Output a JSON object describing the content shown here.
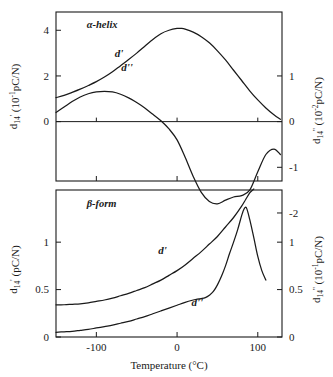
{
  "figure": {
    "xaxis": {
      "label": "Temperature (°C)",
      "ticks": [
        "-100",
        "0",
        "100"
      ],
      "tick_values": [
        -100,
        0,
        100
      ],
      "range": [
        -150,
        130
      ]
    },
    "panels": [
      {
        "name": "alpha-helix",
        "label": "α-helix",
        "left_axis": {
          "symbol": "d",
          "subscript": "14",
          "prime": "'",
          "units": "(10⁻¹pC/N)",
          "text": "d₁₄' (10⁻¹pC/N)",
          "ticks": [
            "0",
            "2",
            "4"
          ],
          "tick_values": [
            0,
            2,
            4
          ],
          "range": [
            -2.6,
            4.8
          ]
        },
        "right_axis": {
          "symbol": "d",
          "subscript": "14",
          "prime": "''",
          "units": "(10⁻²pC/N)",
          "text": "d₁₄'' (10⁻²pC/N)",
          "ticks": [
            "1",
            "0",
            "-1",
            "-2"
          ],
          "tick_values": [
            1,
            0,
            -1,
            -2
          ],
          "range": [
            -2.6,
            4.8
          ]
        },
        "curve_labels": [
          "d'",
          "d''"
        ]
      },
      {
        "name": "beta-form",
        "label": "β-form",
        "left_axis": {
          "symbol": "d",
          "subscript": "14",
          "prime": "'",
          "units": "(pC/N)",
          "text": "d₁₄' (pC/N)",
          "ticks": [
            "0",
            "0.5",
            "1"
          ],
          "tick_values": [
            0,
            0.5,
            1
          ],
          "range": [
            0,
            1.55
          ]
        },
        "right_axis": {
          "symbol": "d",
          "subscript": "14",
          "prime": "''",
          "units": "(10⁻¹pC/N)",
          "text": "d₁₄'' (10⁻¹pC/N)",
          "ticks": [
            "0",
            "0.5",
            "1"
          ],
          "tick_values": [
            0,
            0.5,
            1
          ],
          "range": [
            0,
            1.55
          ]
        },
        "curve_labels": [
          "d'",
          "d''"
        ]
      }
    ]
  },
  "chart_data": [
    {
      "type": "line",
      "title": "α-helix",
      "xlabel": "Temperature (°C)",
      "ylabel": "d₁₄' (10⁻¹pC/N)",
      "ylabel_right": "d₁₄'' (10⁻²pC/N)",
      "xlim": [
        -150,
        130
      ],
      "ylim": [
        -2.6,
        4.8
      ],
      "grid": false,
      "legend": "inline-annotations",
      "series": [
        {
          "name": "d'",
          "axis": "left",
          "label_position": {
            "x": -72,
            "y": 2.85
          },
          "x": [
            -150,
            -140,
            -130,
            -120,
            -110,
            -100,
            -90,
            -80,
            -70,
            -60,
            -50,
            -40,
            -30,
            -20,
            -10,
            0,
            5,
            10,
            20,
            30,
            40,
            50,
            60,
            70,
            80,
            90,
            100,
            110,
            120,
            128
          ],
          "y": [
            1.05,
            1.15,
            1.28,
            1.42,
            1.58,
            1.75,
            1.95,
            2.18,
            2.45,
            2.72,
            3.0,
            3.3,
            3.6,
            3.85,
            4.0,
            4.08,
            4.08,
            4.05,
            3.92,
            3.72,
            3.45,
            3.1,
            2.7,
            2.25,
            1.8,
            1.35,
            0.95,
            0.6,
            0.3,
            0.1
          ]
        },
        {
          "name": "d''",
          "axis": "right",
          "label_position": {
            "x": -62,
            "y": 1.1
          },
          "x": [
            -150,
            -140,
            -130,
            -120,
            -110,
            -100,
            -90,
            -80,
            -70,
            -60,
            -50,
            -40,
            -30,
            -20,
            -10,
            0,
            10,
            20,
            30,
            40,
            50,
            60,
            70,
            80,
            90,
            100,
            110,
            120,
            128
          ],
          "y": [
            0.2,
            0.32,
            0.44,
            0.54,
            0.61,
            0.65,
            0.66,
            0.65,
            0.6,
            0.52,
            0.42,
            0.3,
            0.16,
            0.02,
            -0.16,
            -0.4,
            -0.78,
            -1.2,
            -1.55,
            -1.75,
            -1.8,
            -1.72,
            -1.65,
            -1.62,
            -1.5,
            -1.1,
            -0.72,
            -0.6,
            -0.72
          ]
        }
      ]
    },
    {
      "type": "line",
      "title": "β-form",
      "xlabel": "Temperature (°C)",
      "ylabel": "d₁₄' (pC/N)",
      "ylabel_right": "d₁₄'' (10⁻¹pC/N)",
      "xlim": [
        -150,
        130
      ],
      "ylim": [
        0,
        1.55
      ],
      "grid": false,
      "legend": "inline-annotations",
      "series": [
        {
          "name": "d'",
          "axis": "left",
          "label_position": {
            "x": -18,
            "y": 0.88
          },
          "x": [
            -150,
            -140,
            -130,
            -120,
            -110,
            -100,
            -90,
            -80,
            -70,
            -60,
            -50,
            -40,
            -30,
            -20,
            -10,
            0,
            10,
            20,
            30,
            40,
            50,
            60,
            70,
            80,
            85,
            90,
            95
          ],
          "y": [
            0.34,
            0.34,
            0.345,
            0.35,
            0.36,
            0.375,
            0.39,
            0.41,
            0.435,
            0.46,
            0.49,
            0.52,
            0.56,
            0.6,
            0.65,
            0.7,
            0.76,
            0.83,
            0.9,
            0.98,
            1.06,
            1.16,
            1.26,
            1.38,
            1.45,
            1.52,
            1.56
          ]
        },
        {
          "name": "d''",
          "axis": "right",
          "label_position": {
            "x": 25,
            "y": 0.33
          },
          "x": [
            -150,
            -140,
            -130,
            -120,
            -110,
            -100,
            -90,
            -80,
            -70,
            -60,
            -50,
            -40,
            -30,
            -20,
            -10,
            0,
            10,
            20,
            25,
            30,
            35,
            40,
            45,
            50,
            55,
            60,
            65,
            70,
            75,
            80,
            83,
            86,
            90,
            95,
            100,
            105,
            110
          ],
          "y": [
            0.05,
            0.055,
            0.06,
            0.07,
            0.08,
            0.095,
            0.11,
            0.125,
            0.145,
            0.165,
            0.19,
            0.215,
            0.245,
            0.275,
            0.305,
            0.335,
            0.365,
            0.39,
            0.4,
            0.405,
            0.415,
            0.44,
            0.48,
            0.55,
            0.64,
            0.75,
            0.88,
            1.0,
            1.13,
            1.28,
            1.35,
            1.36,
            1.24,
            1.05,
            0.85,
            0.7,
            0.6
          ]
        }
      ]
    }
  ]
}
